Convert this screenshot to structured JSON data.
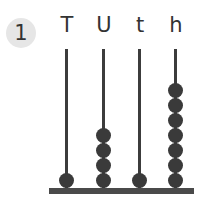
{
  "question_number": "1",
  "columns": [
    {
      "label": "T",
      "beads": 1
    },
    {
      "label": "U",
      "beads": 4
    },
    {
      "label": "t",
      "beads": 1
    },
    {
      "label": "h",
      "beads": 7
    }
  ],
  "colors": {
    "bead": "#3a3a3a",
    "rod": "#3c3c3c",
    "badge_bg": "#e6e6e6"
  }
}
